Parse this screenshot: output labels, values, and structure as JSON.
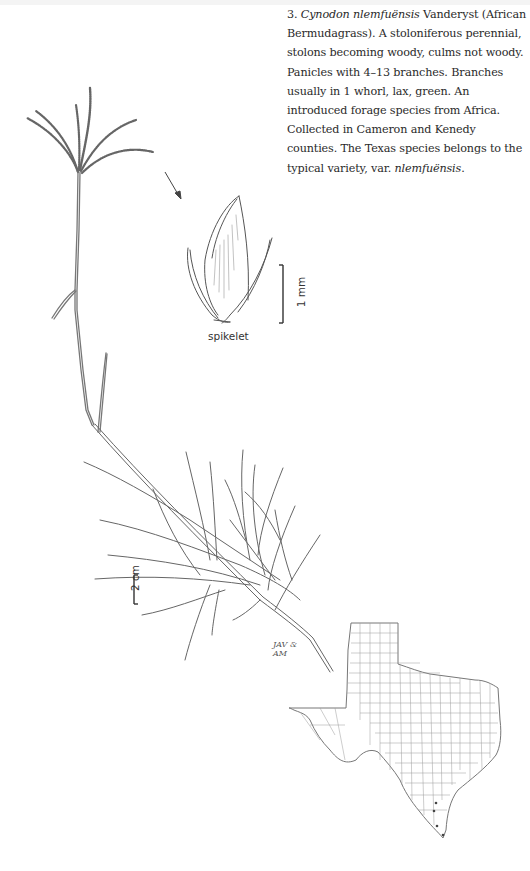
{
  "entry": {
    "number": "3.",
    "genus_species": "Cynodon nlemfuënsis",
    "authority": "Vanderyst",
    "common_name_open": "(African Bermudagrass).",
    "text_1": "A stoloniferous perennial, stolons becoming woody, culms not woody. Panicles with 4–13 branches. Branches usually in 1 whorl, lax, green. An introduced forage species from Africa. Collected in Cameron and Kenedy counties. The Texas species belongs to the typical variety, var.",
    "variety": "nlemfuënsis",
    "text_end": "."
  },
  "illustration": {
    "detail_label": "spikelet",
    "detail_scale": "1 mm",
    "plant_scale": "2 cm",
    "signature_line1": "JAV &",
    "signature_line2": "AM"
  },
  "distribution_map": {
    "region": "Texas",
    "counties_collected": [
      "Cameron",
      "Kenedy"
    ],
    "marker_color": "#444444"
  },
  "colors": {
    "text": "#2a2a2a",
    "linework": "#555555",
    "map_lines": "#9a9a9a",
    "background": "#ffffff"
  }
}
